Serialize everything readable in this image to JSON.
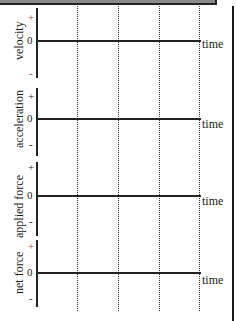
{
  "diagram": {
    "time_label": "time",
    "zero": "0",
    "plus": "+",
    "minus": "-",
    "panels": [
      {
        "label": "velocity"
      },
      {
        "label": "acceleration"
      },
      {
        "label": "applied force"
      },
      {
        "label": "net force"
      }
    ],
    "colors": {
      "axis": "#222222",
      "sign_marks": "#b04040",
      "banner": "#8a8a8a"
    }
  }
}
